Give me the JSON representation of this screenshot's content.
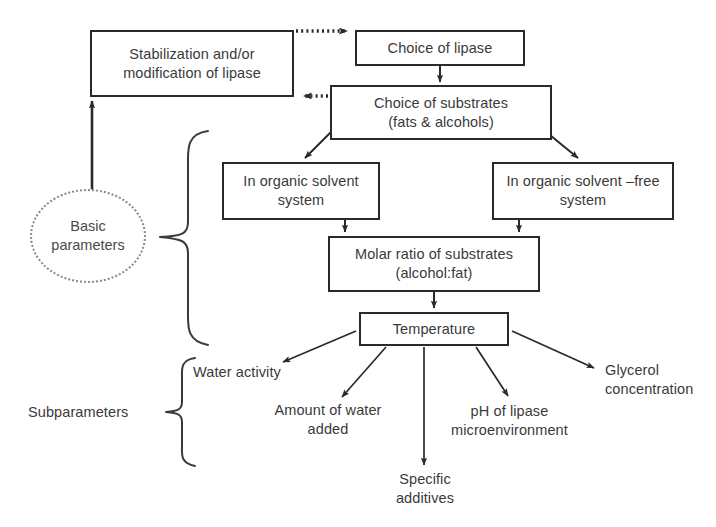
{
  "diagram": {
    "type": "flowchart",
    "colors": {
      "background": "#ffffff",
      "box_stroke": "#2a2a2a",
      "text": "#3a3a3a",
      "circle_stroke": "#8a8a8a",
      "arrow": "#2a2a2a"
    },
    "boxes": [
      {
        "id": "stabilization",
        "label": "Stabilization and/or\nmodification of lipase",
        "x": 90,
        "y": 30,
        "w": 204,
        "h": 67
      },
      {
        "id": "choice-of-lipase",
        "label": "Choice of lipase",
        "x": 355,
        "y": 30,
        "w": 170,
        "h": 36
      },
      {
        "id": "choice-of-substrates",
        "label": "Choice of substrates\n(fats & alcohols)",
        "x": 330,
        "y": 85,
        "w": 222,
        "h": 55
      },
      {
        "id": "organic-solvent-system",
        "label": "In organic solvent\nsystem",
        "x": 222,
        "y": 162,
        "w": 158,
        "h": 58
      },
      {
        "id": "organic-solvent-free-system",
        "label": "In organic solvent –free\nsystem",
        "x": 492,
        "y": 162,
        "w": 182,
        "h": 58
      },
      {
        "id": "molar-ratio",
        "label": "Molar ratio of substrates\n(alcohol:fat)",
        "x": 328,
        "y": 236,
        "w": 212,
        "h": 56
      },
      {
        "id": "temperature",
        "label": "Temperature",
        "x": 359,
        "y": 312,
        "w": 150,
        "h": 34
      }
    ],
    "circle": {
      "id": "basic-parameters",
      "label": "Basic\nparameters",
      "x": 30,
      "y": 189,
      "w": 116,
      "h": 94
    },
    "labels": [
      {
        "id": "subparameters",
        "text": "Subparameters",
        "x": 28,
        "y": 403,
        "w": 130,
        "align": "left"
      },
      {
        "id": "water-activity",
        "text": "Water activity",
        "x": 193,
        "y": 363,
        "w": 135,
        "align": "left"
      },
      {
        "id": "amount-of-water-added",
        "text": "Amount of water\nadded",
        "x": 258,
        "y": 401,
        "w": 140,
        "align": "center"
      },
      {
        "id": "specific-additives",
        "text": "Specific\nadditives",
        "x": 375,
        "y": 470,
        "w": 100,
        "align": "center"
      },
      {
        "id": "ph-of-lipase-microenvironment",
        "text": "pH of lipase\nmicroenvironment",
        "x": 432,
        "y": 402,
        "w": 155,
        "align": "center"
      },
      {
        "id": "glycerol-concentration",
        "text": "Glycerol\nconcentration",
        "x": 605,
        "y": 361,
        "w": 112,
        "align": "left"
      }
    ],
    "braces": [
      {
        "id": "basic-parameters-brace",
        "spans": "basic parameters group"
      },
      {
        "id": "subparameters-brace",
        "spans": "subparameters group"
      }
    ],
    "connections": [
      {
        "id": "stabilization-to-choice-of-lipase",
        "style": "dotted",
        "from": "stabilization",
        "to": "choice-of-lipase"
      },
      {
        "id": "choice-of-substrates-to-stabilization",
        "style": "dotted",
        "from": "choice-of-substrates",
        "to": "stabilization"
      },
      {
        "id": "choice-of-lipase-to-choice-of-substrates",
        "style": "solid",
        "from": "choice-of-lipase",
        "to": "choice-of-substrates"
      },
      {
        "id": "choice-of-substrates-to-organic-solvent-system",
        "style": "solid",
        "from": "choice-of-substrates",
        "to": "organic-solvent-system"
      },
      {
        "id": "choice-of-substrates-to-organic-solvent-free-system",
        "style": "solid",
        "from": "choice-of-substrates",
        "to": "organic-solvent-free-system"
      },
      {
        "id": "organic-solvent-system-to-molar-ratio",
        "style": "solid",
        "from": "organic-solvent-system",
        "to": "molar-ratio"
      },
      {
        "id": "organic-solvent-free-system-to-molar-ratio",
        "style": "solid",
        "from": "organic-solvent-free-system",
        "to": "molar-ratio"
      },
      {
        "id": "molar-ratio-to-temperature",
        "style": "solid",
        "from": "molar-ratio",
        "to": "temperature"
      },
      {
        "id": "basic-parameters-to-stabilization",
        "style": "solid",
        "from": "basic-parameters",
        "to": "stabilization"
      },
      {
        "id": "temperature-to-water-activity",
        "style": "solid",
        "from": "temperature",
        "to": "water-activity"
      },
      {
        "id": "temperature-to-amount-of-water-added",
        "style": "solid",
        "from": "temperature",
        "to": "amount-of-water-added"
      },
      {
        "id": "temperature-to-specific-additives",
        "style": "solid",
        "from": "temperature",
        "to": "specific-additives"
      },
      {
        "id": "temperature-to-ph-of-lipase-microenvironment",
        "style": "solid",
        "from": "temperature",
        "to": "ph-of-lipase-microenvironment"
      },
      {
        "id": "temperature-to-glycerol-concentration",
        "style": "solid",
        "from": "temperature",
        "to": "glycerol-concentration"
      }
    ]
  }
}
